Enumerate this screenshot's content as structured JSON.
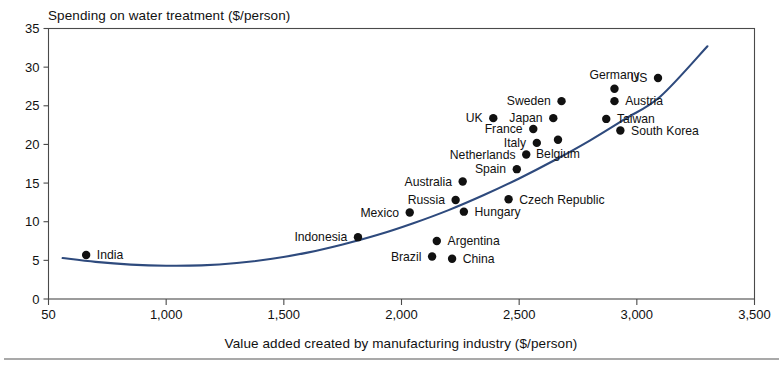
{
  "chart_data": {
    "type": "scatter",
    "title": "",
    "ylabel": "Spending on water treatment ($/person)",
    "xlabel": "Value added created by manufacturing industry ($/person)",
    "xlim": [
      500,
      3500
    ],
    "ylim": [
      0,
      35
    ],
    "grid": false,
    "legend": "none",
    "x_ticks": [
      {
        "value": 500,
        "label": "50"
      },
      {
        "value": 1000,
        "label": "1,000"
      },
      {
        "value": 1500,
        "label": "1,500"
      },
      {
        "value": 2000,
        "label": "2,000"
      },
      {
        "value": 2500,
        "label": "2,500"
      },
      {
        "value": 3000,
        "label": "3,000"
      },
      {
        "value": 3500,
        "label": "3,500"
      }
    ],
    "y_ticks": [
      {
        "value": 0,
        "label": "0"
      },
      {
        "value": 5,
        "label": "5"
      },
      {
        "value": 10,
        "label": "10"
      },
      {
        "value": 15,
        "label": "15"
      },
      {
        "value": 20,
        "label": "20"
      },
      {
        "value": 25,
        "label": "25"
      },
      {
        "value": 30,
        "label": "30"
      },
      {
        "value": 35,
        "label": "35"
      }
    ],
    "point_color": "#111111",
    "trendline_color": "#2e4a7d",
    "points": [
      {
        "name": "India",
        "x": 660,
        "y": 5.7,
        "label_side": "right"
      },
      {
        "name": "Indonesia",
        "x": 1815,
        "y": 8.0,
        "label_side": "left"
      },
      {
        "name": "Brazil",
        "x": 2130,
        "y": 5.5,
        "label_side": "left"
      },
      {
        "name": "China",
        "x": 2215,
        "y": 5.2,
        "label_side": "right"
      },
      {
        "name": "Argentina",
        "x": 2150,
        "y": 7.5,
        "label_side": "right"
      },
      {
        "name": "Mexico",
        "x": 2035,
        "y": 11.2,
        "label_side": "left"
      },
      {
        "name": "Hungary",
        "x": 2265,
        "y": 11.3,
        "label_side": "right"
      },
      {
        "name": "Russia",
        "x": 2230,
        "y": 12.8,
        "label_side": "left"
      },
      {
        "name": "Czech Republic",
        "x": 2455,
        "y": 12.9,
        "label_side": "right"
      },
      {
        "name": "Australia",
        "x": 2260,
        "y": 15.2,
        "label_side": "left"
      },
      {
        "name": "Spain",
        "x": 2490,
        "y": 16.8,
        "label_side": "left"
      },
      {
        "name": "Netherlands",
        "x": 2530,
        "y": 18.7,
        "label_side": "left"
      },
      {
        "name": "Italy",
        "x": 2575,
        "y": 20.2,
        "label_side": "left"
      },
      {
        "name": "Belgium",
        "x": 2665,
        "y": 20.6,
        "label_side": "below"
      },
      {
        "name": "France",
        "x": 2560,
        "y": 22.0,
        "label_side": "left"
      },
      {
        "name": "UK",
        "x": 2390,
        "y": 23.4,
        "label_side": "left"
      },
      {
        "name": "Japan",
        "x": 2645,
        "y": 23.4,
        "label_side": "left"
      },
      {
        "name": "Taiwan",
        "x": 2870,
        "y": 23.3,
        "label_side": "right"
      },
      {
        "name": "South Korea",
        "x": 2930,
        "y": 21.8,
        "label_side": "right"
      },
      {
        "name": "Sweden",
        "x": 2680,
        "y": 25.6,
        "label_side": "left"
      },
      {
        "name": "Austria",
        "x": 2905,
        "y": 25.6,
        "label_side": "right"
      },
      {
        "name": "Germany",
        "x": 2905,
        "y": 27.2,
        "label_side": "above"
      },
      {
        "name": "US",
        "x": 3090,
        "y": 28.6,
        "label_side": "left"
      }
    ],
    "trendline": [
      {
        "x": 560,
        "y": 5.3
      },
      {
        "x": 700,
        "y": 4.8
      },
      {
        "x": 850,
        "y": 4.45
      },
      {
        "x": 1000,
        "y": 4.3
      },
      {
        "x": 1150,
        "y": 4.35
      },
      {
        "x": 1300,
        "y": 4.65
      },
      {
        "x": 1450,
        "y": 5.2
      },
      {
        "x": 1600,
        "y": 6.0
      },
      {
        "x": 1750,
        "y": 7.05
      },
      {
        "x": 1900,
        "y": 8.3
      },
      {
        "x": 2050,
        "y": 9.8
      },
      {
        "x": 2200,
        "y": 11.5
      },
      {
        "x": 2350,
        "y": 13.45
      },
      {
        "x": 2500,
        "y": 15.6
      },
      {
        "x": 2650,
        "y": 17.95
      },
      {
        "x": 2800,
        "y": 20.5
      },
      {
        "x": 2950,
        "y": 23.3
      },
      {
        "x": 3100,
        "y": 26.2
      },
      {
        "x": 3300,
        "y": 32.7
      }
    ]
  }
}
